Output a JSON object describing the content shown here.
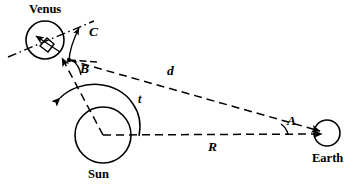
{
  "figure": {
    "background_color": "#ffffff",
    "stroke_color": "#000000",
    "width": 362,
    "height": 189
  },
  "bodies": {
    "venus": {
      "label": "Venus",
      "cx": 45,
      "cy": 40,
      "r": 19
    },
    "sun": {
      "label": "Sun",
      "cx": 103,
      "cy": 135,
      "r": 28
    },
    "earth": {
      "label": "Earth",
      "cx": 327,
      "cy": 133,
      "r": 13
    }
  },
  "measures": {
    "distance_venus_earth": "d",
    "distance_sun_earth": "R",
    "angle_at_earth": "A",
    "angle_at_venus_lower": "B",
    "angle_at_venus_upper": "C",
    "angle_at_sun": "t"
  },
  "annotations": {
    "right_angle_marker": "right-angle",
    "line_style_dashed": "dashed",
    "line_style_dashdot": "dash-dot"
  }
}
